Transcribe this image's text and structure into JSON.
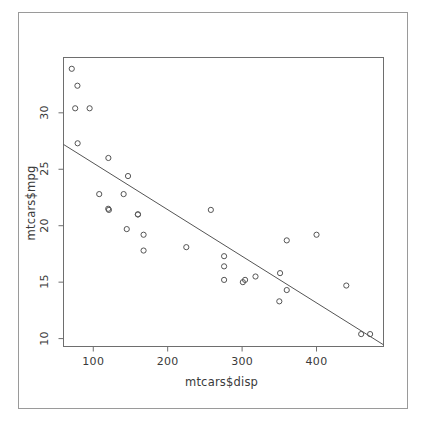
{
  "chart_data": {
    "type": "scatter",
    "title": "",
    "xlabel": "mtcars$disp",
    "ylabel": "mtcars$mpg",
    "xlim": [
      60,
      490
    ],
    "ylim": [
      9.3,
      34.9
    ],
    "xticks": [
      100,
      200,
      300,
      400
    ],
    "yticks": [
      10,
      15,
      20,
      25,
      30
    ],
    "grid": false,
    "legend": null,
    "marker": "open-circle",
    "point_color": "#555555",
    "line_color": "#555555",
    "frame": true,
    "x": [
      160,
      160,
      108,
      258,
      360,
      225,
      360,
      146.7,
      140.8,
      167.6,
      167.6,
      275.8,
      275.8,
      275.8,
      472,
      460,
      440,
      78.7,
      75.7,
      71.1,
      120.1,
      318,
      304,
      350,
      400,
      79,
      120.3,
      95.1,
      351,
      145,
      301,
      121
    ],
    "y": [
      21.0,
      21.0,
      22.8,
      21.4,
      18.7,
      18.1,
      14.3,
      24.4,
      22.8,
      19.2,
      17.8,
      16.4,
      17.3,
      15.2,
      10.4,
      10.4,
      14.7,
      32.4,
      30.4,
      33.9,
      21.5,
      15.5,
      15.2,
      13.3,
      19.2,
      27.3,
      26.0,
      30.4,
      15.8,
      19.7,
      15.0,
      21.4
    ],
    "regression_line": {
      "x_start": 60,
      "y_start": 27.2,
      "x_end": 490,
      "y_end": 9.45,
      "slope": -0.0412,
      "intercept": 29.6
    }
  },
  "axes": {
    "x_tick_labels": [
      "100",
      "200",
      "300",
      "400"
    ],
    "y_tick_labels": [
      "10",
      "15",
      "20",
      "25",
      "30"
    ],
    "x_title": "mtcars$disp",
    "y_title": "mtcars$mpg"
  }
}
